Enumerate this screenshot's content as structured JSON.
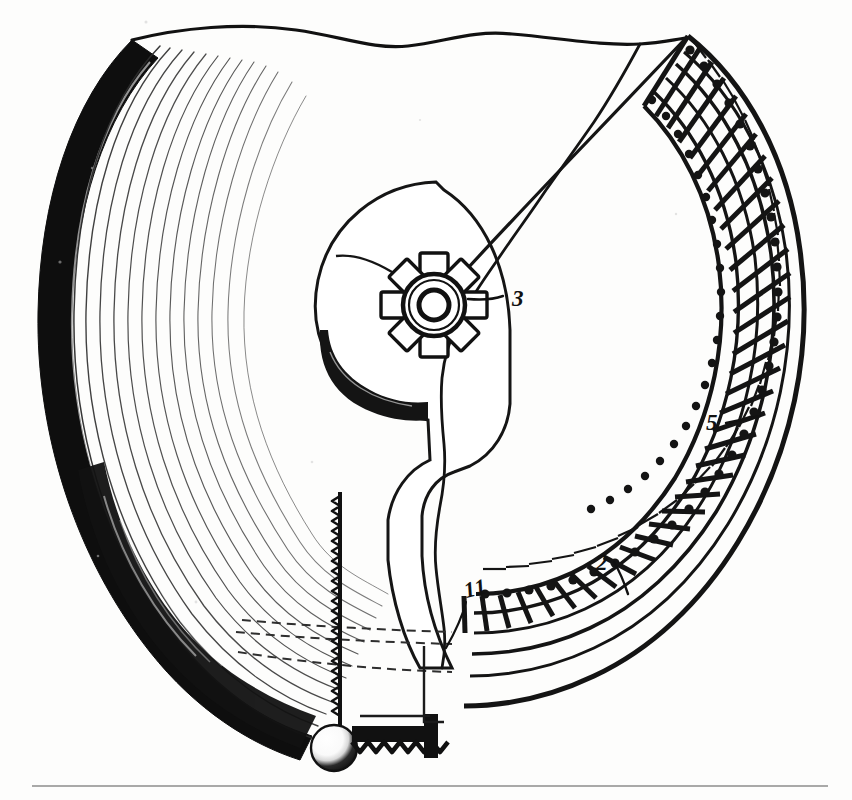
{
  "figure": {
    "kind": "engineering-sectional-diagram",
    "background_color": "#fdfdfc",
    "ink_color": "#111111"
  },
  "callouts": [
    {
      "id": "callout-3",
      "label": "3",
      "target": "sprocket-hub",
      "x": 512,
      "y": 298,
      "font_size": 22,
      "leader": {
        "from_x": 503,
        "from_y": 296,
        "to_x": 468,
        "to_y": 299
      }
    },
    {
      "id": "callout-5",
      "label": "5",
      "target": "chain-inner-rail",
      "x": 714,
      "y": 429,
      "font_size": 22,
      "leader": {
        "from_x": 726,
        "from_y": 423,
        "to_x": 757,
        "to_y": 417
      }
    },
    {
      "id": "callout-2",
      "label": "2",
      "target": "chain-outer-rail",
      "x": 601,
      "y": 566,
      "font_size": 22,
      "leader": {
        "from_x": 614,
        "from_y": 562,
        "to_x": 628,
        "to_y": 592
      }
    },
    {
      "id": "callout-11",
      "label": "11",
      "target": "drum-rim-edge",
      "x": 468,
      "y": 597,
      "font_size": 21,
      "leader": {
        "from_x": 466,
        "from_y": 600,
        "to_x": 448,
        "to_y": 645
      }
    }
  ],
  "components": {
    "coil_spring": {
      "name": "coiled-spring-band",
      "turn_count": 13,
      "band_fill": "#0d0d0d"
    },
    "sprocket_hub": {
      "name": "sprocket-hub",
      "lug_count": 8,
      "center_x": 434,
      "center_y": 305,
      "bore_radius": 15,
      "ring_radius": 29,
      "lug_radius": 46
    },
    "chain_track": {
      "name": "roller-chain-track",
      "cross_link_count": 44,
      "rail_count": 4
    },
    "rack": {
      "name": "toothed-rack",
      "tooth_count": 26,
      "x": 338,
      "top_y": 492,
      "bottom_y": 722
    },
    "ball": {
      "name": "ball-end",
      "center_x": 334,
      "center_y": 748,
      "radius": 22
    },
    "bottom_rack": {
      "name": "horizontal-toothed-bar",
      "tooth_count": 9
    },
    "page_rule": {
      "name": "page-divider-rule",
      "x1": 32,
      "x2": 828,
      "y": 786
    }
  }
}
